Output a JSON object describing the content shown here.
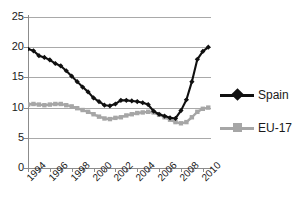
{
  "chart_data": {
    "type": "line",
    "title": "",
    "xlabel": "",
    "ylabel": "",
    "ylim": [
      0,
      25
    ],
    "xlim": [
      1994,
      2010.75
    ],
    "yticks": [
      0,
      5,
      10,
      15,
      20,
      25
    ],
    "ytick_labels": [
      "0",
      "5",
      "10",
      "15",
      "20",
      "25"
    ],
    "xtick_labels": [
      "1994",
      "1996",
      "1998",
      "2000",
      "2002",
      "2004",
      "2006",
      "2008",
      "2010"
    ],
    "xtick_values": [
      1994,
      1996,
      1998,
      2000,
      2002,
      2004,
      2006,
      2008,
      2010
    ],
    "grid": "horizontal",
    "legend_position": "right",
    "x": [
      1994,
      1994.5,
      1995,
      1995.5,
      1996,
      1996.5,
      1997,
      1997.5,
      1998,
      1998.5,
      1999,
      1999.5,
      2000,
      2000.5,
      2001,
      2001.5,
      2002,
      2002.5,
      2003,
      2003.5,
      2004,
      2004.5,
      2005,
      2005.5,
      2006,
      2006.5,
      2007,
      2007.5,
      2008,
      2008.5,
      2009,
      2009.5,
      2010,
      2010.5
    ],
    "series": [
      {
        "name": "Spain",
        "color": "#101010",
        "marker": "diamond",
        "values": [
          19.7,
          19.4,
          18.6,
          18.3,
          17.9,
          17.3,
          16.9,
          16.1,
          15.2,
          14.3,
          13.4,
          12.6,
          11.6,
          11.0,
          10.4,
          10.3,
          10.6,
          11.2,
          11.2,
          11.1,
          11.0,
          10.8,
          10.5,
          9.4,
          8.9,
          8.6,
          8.3,
          8.2,
          9.5,
          11.3,
          14.3,
          18.0,
          19.3,
          20.0
        ]
      },
      {
        "name": "EU-17",
        "color": "#a6a6a6",
        "marker": "square",
        "values": [
          10.5,
          10.6,
          10.5,
          10.4,
          10.5,
          10.6,
          10.6,
          10.4,
          10.2,
          9.9,
          9.6,
          9.3,
          8.9,
          8.5,
          8.2,
          8.1,
          8.3,
          8.4,
          8.7,
          8.9,
          9.1,
          9.2,
          9.3,
          9.2,
          8.8,
          8.4,
          8.0,
          7.6,
          7.4,
          7.6,
          8.4,
          9.3,
          9.8,
          10.0
        ]
      }
    ]
  }
}
